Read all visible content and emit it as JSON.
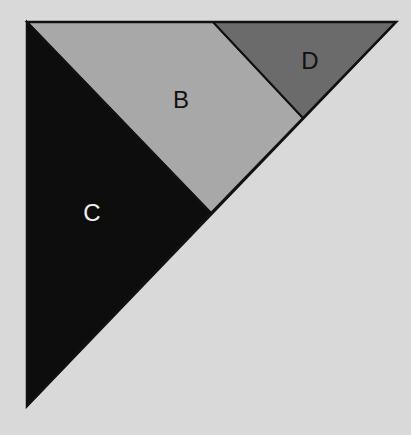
{
  "diagram": {
    "background": "#d9d9d9",
    "stroke": "#111111",
    "outer_triangle": {
      "vertices": [
        [
          27,
          22
        ],
        [
          396,
          22
        ],
        [
          27,
          406
        ]
      ]
    },
    "regions": [
      {
        "id": "B",
        "label": "B",
        "fill": "#a8a8a8",
        "label_color": "#111111",
        "points": "27,22 213,22 303,118 211,213",
        "label_pos": [
          181,
          108
        ]
      },
      {
        "id": "C",
        "label": "C",
        "fill": "#0d0d0d",
        "label_color": "#f0f0f0",
        "points": "27,22 211,213 27,406",
        "label_pos": [
          92,
          221
        ]
      },
      {
        "id": "D",
        "label": "D",
        "fill": "#6b6b6b",
        "label_color": "#111111",
        "points": "213,22 396,22 303,118",
        "label_pos": [
          310,
          69
        ]
      }
    ]
  }
}
